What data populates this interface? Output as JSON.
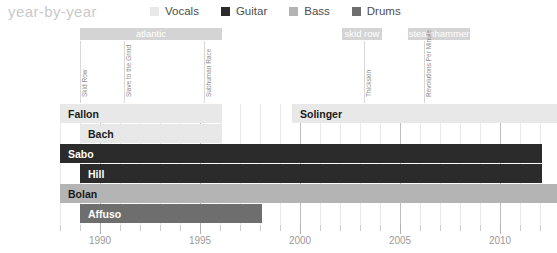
{
  "header": {
    "title": "year-by-year"
  },
  "legend": {
    "items": [
      {
        "label": "Vocals",
        "color": "#e8e8e8"
      },
      {
        "label": "Guitar",
        "color": "#2b2b2b"
      },
      {
        "label": "Bass",
        "color": "#b4b4b4"
      },
      {
        "label": "Drums",
        "color": "#6e6e6e"
      }
    ]
  },
  "chart_data": {
    "type": "bar",
    "title": "year-by-year",
    "xlabel": "",
    "ylabel": "",
    "xlim": [
      1988,
      2012.85
    ],
    "grid": true,
    "legend_position": "top",
    "x_ticks_major": [
      1990,
      1995,
      2000,
      2005,
      2010
    ],
    "x_tick_labels": [
      "1990",
      "1995",
      "2000",
      "2005",
      "2010"
    ],
    "x_ticks_minor_step": 1,
    "categories": [
      "Fallon",
      "Bach",
      "Sabo",
      "Hill",
      "Bolan",
      "Affuso",
      "Solinger"
    ],
    "series": [
      {
        "name": "Fallon",
        "role": "Vocals",
        "color": "#e8e8e8",
        "start": 1988,
        "end": 1996.1,
        "label": "Fallon"
      },
      {
        "name": "Bach",
        "role": "Vocals",
        "color": "#e8e8e8",
        "start": 1989.0,
        "end": 1996.1,
        "label": "Bach"
      },
      {
        "name": "Sabo",
        "role": "Guitar",
        "color": "#2b2b2b",
        "start": 1988,
        "end": 2012.1,
        "label": "Sabo"
      },
      {
        "name": "Hill",
        "role": "Guitar",
        "color": "#2b2b2b",
        "start": 1989.0,
        "end": 2012.1,
        "label": "Hill"
      },
      {
        "name": "Bolan",
        "role": "Bass",
        "color": "#b4b4b4",
        "start": 1988,
        "end": 2012.85,
        "label": "Bolan"
      },
      {
        "name": "Affuso",
        "role": "Drums",
        "color": "#6e6e6e",
        "start": 1989.0,
        "end": 1998.1,
        "label": "Affuso"
      },
      {
        "name": "Solinger",
        "role": "Vocals",
        "color": "#e8e8e8",
        "start": 1999.6,
        "end": 2012.85,
        "label": "Solinger"
      }
    ],
    "record_labels": [
      {
        "name": "atlantic",
        "start": 1989.0,
        "end": 1996.1
      },
      {
        "name": "skid row",
        "start": 2002.1,
        "end": 2004.1
      },
      {
        "name": "steamhammer",
        "start": 2005.4,
        "end": 2008.5
      }
    ],
    "albums": [
      {
        "name": "Skid Row",
        "year": 1989.0
      },
      {
        "name": "Slave to the Grind",
        "year": 1991.2
      },
      {
        "name": "Subhuman Race",
        "year": 1995.2
      },
      {
        "name": "Thickskin",
        "year": 2003.2
      },
      {
        "name": "Revolutions Per Minute",
        "year": 2006.2
      }
    ]
  }
}
